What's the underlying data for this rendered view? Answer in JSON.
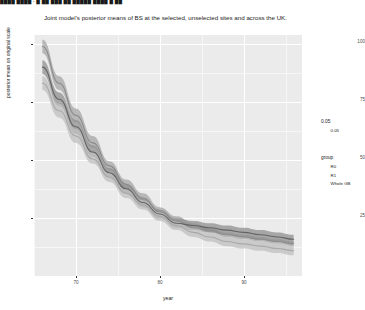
{
  "top_strip": {
    "text": "████ ████ ∙ █ ██ ███ ██ █████ ████ █ ██"
  },
  "chart_data": {
    "type": "line",
    "title": "Joint model's posterior means of BS at the selected, unselected sites and across the UK.",
    "xlabel": "year",
    "ylabel": "posterior mean on original scale",
    "grid": true,
    "panel_background": "#ebebeb",
    "gridline_color": "#ffffff",
    "xlim": [
      64,
      96
    ],
    "ylim": [
      0,
      105
    ],
    "x_ticks": [
      70,
      80,
      90
    ],
    "x_tick_labels": [
      "70",
      "80",
      "90"
    ],
    "y_ticks": [
      25,
      50,
      75,
      100
    ],
    "y_tick_labels": [
      "25",
      "50",
      "75",
      "100"
    ],
    "legend_position": "right",
    "series": [
      {
        "name": "R0",
        "color": "#8c8c8c",
        "band_color": "#a6a6a6",
        "x": [
          65,
          67,
          69,
          71,
          73,
          75,
          77,
          79,
          81,
          83,
          85,
          87,
          89,
          91,
          93,
          95
        ],
        "values": [
          100,
          84,
          70,
          58,
          48,
          40,
          34,
          28,
          24,
          21,
          20,
          18,
          17,
          16,
          15,
          14
        ],
        "band_lower": [
          97,
          81,
          67,
          56,
          46,
          38,
          32,
          27,
          23,
          20,
          19,
          17,
          16,
          15,
          14,
          13
        ],
        "band_upper": [
          103,
          87,
          73,
          61,
          50,
          42,
          36,
          30,
          26,
          23,
          21,
          19,
          18,
          17,
          16,
          15
        ]
      },
      {
        "name": "R1",
        "color": "#636363",
        "band_color": "#8f8f8f",
        "x": [
          65,
          67,
          69,
          71,
          73,
          75,
          77,
          79,
          81,
          83,
          85,
          87,
          89,
          91,
          93,
          95
        ],
        "values": [
          91,
          77,
          65,
          54,
          45,
          38,
          32,
          27,
          23,
          22,
          21,
          20,
          19,
          18,
          17,
          16
        ],
        "band_lower": [
          88,
          74,
          62,
          52,
          43,
          36,
          30,
          25,
          21,
          20,
          19,
          18,
          17,
          16,
          15,
          14
        ],
        "band_upper": [
          94,
          80,
          68,
          57,
          47,
          40,
          34,
          29,
          25,
          24,
          23,
          22,
          21,
          20,
          19,
          18
        ]
      },
      {
        "name": "Whole GB",
        "color": "#a8a8a8",
        "band_color": "#bfbfbf",
        "x": [
          65,
          67,
          69,
          71,
          73,
          75,
          77,
          79,
          81,
          83,
          85,
          87,
          89,
          91,
          93,
          95
        ],
        "values": [
          84,
          72,
          61,
          51,
          43,
          36,
          31,
          26,
          22,
          19,
          17,
          15,
          14,
          13,
          12,
          11
        ],
        "band_lower": [
          81,
          69,
          58,
          49,
          41,
          34,
          29,
          24,
          20,
          17,
          15,
          13,
          12,
          11,
          10,
          9
        ],
        "band_upper": [
          87,
          75,
          64,
          54,
          45,
          38,
          33,
          28,
          24,
          21,
          19,
          17,
          16,
          15,
          14,
          13
        ]
      }
    ]
  },
  "legends": {
    "alpha": {
      "title": "0.05",
      "items": [
        {
          "label": "0.05",
          "color": "#8c8c8c"
        }
      ]
    },
    "group": {
      "title": "group",
      "items": [
        {
          "label": "R0",
          "color": "#4d4d4d"
        },
        {
          "label": "R1",
          "color": "#7a7a7a"
        },
        {
          "label": "Whole GB",
          "color": "#a6a6a6"
        }
      ]
    }
  }
}
